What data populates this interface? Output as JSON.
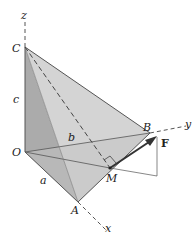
{
  "diagram": {
    "axes": {
      "x_label": "x",
      "y_label": "y",
      "z_label": "z"
    },
    "points": {
      "O": "O",
      "A": "A",
      "B": "B",
      "C": "C",
      "M": "M"
    },
    "dimensions": {
      "a": "a",
      "b": "b",
      "c": "c"
    },
    "force_label": "F",
    "colors": {
      "face_light": "#d9d9d9",
      "face_mid": "#c4c4c4",
      "face_dark": "#a9a9a9",
      "edge": "#555555",
      "arrow": "#333333"
    }
  }
}
